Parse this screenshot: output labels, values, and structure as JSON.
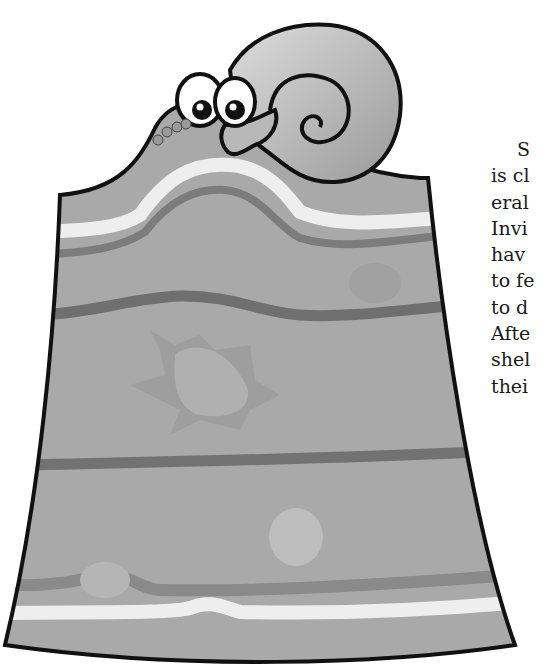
{
  "page": {
    "illustration": {
      "subject": "cartoon snail peeking over layered rock strata",
      "elements": [
        "snail",
        "rock-strata-block",
        "fossil-star-shape",
        "fossil-blob",
        "fossil-pebble"
      ]
    },
    "body_text_lines": [
      "S",
      "is cl",
      "eral",
      "Invi",
      "hav",
      "to fe",
      "to d",
      "Afte",
      "shel",
      "thei"
    ]
  },
  "colors": {
    "outline": "#111111",
    "strata_base": "#a9a9a9",
    "strata_dark_band": "#7c7c7c",
    "strata_light_band": "#eeeeee",
    "snail_shell": "#b8b8b8",
    "text": "#1a1a1a"
  }
}
